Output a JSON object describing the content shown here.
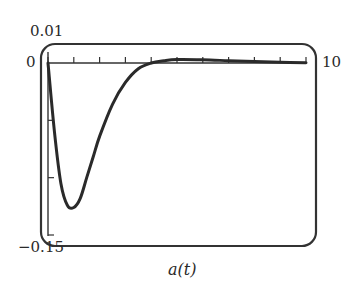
{
  "chart_data": {
    "type": "line",
    "title": "",
    "xlabel": "a(t)",
    "ylabel": "",
    "xlim": [
      0,
      10
    ],
    "ylim": [
      -0.15,
      0.01
    ],
    "tick_labels": {
      "y_top": "0.01",
      "y_zero": "0",
      "y_bottom": "−0.15",
      "x_max": "10"
    },
    "x_ticks": [
      0,
      1,
      2,
      3,
      4,
      5,
      6,
      7,
      8,
      9,
      10
    ],
    "y_ticks": [
      -0.05,
      -0.1,
      -0.15
    ],
    "grid": false,
    "legend": null,
    "series": [
      {
        "name": "a(t)",
        "x": [
          0,
          0.25,
          0.5,
          0.75,
          1.0,
          1.25,
          1.5,
          1.75,
          2.0,
          2.5,
          3.0,
          3.5,
          4.0,
          4.5,
          5.0,
          6.0,
          7.0,
          8.0,
          9.0,
          10.0
        ],
        "values": [
          0,
          -0.06,
          -0.105,
          -0.124,
          -0.126,
          -0.118,
          -0.1,
          -0.082,
          -0.064,
          -0.036,
          -0.017,
          -0.005,
          0.0,
          0.002,
          0.003,
          0.0028,
          0.002,
          0.0012,
          0.0006,
          0.0002
        ]
      }
    ]
  },
  "labels": {
    "y_top": "0.01",
    "y_zero": "0",
    "y_bottom": "−0.15",
    "x_max": "10",
    "x_title": "a(t)"
  },
  "colors": {
    "line": "#2a2a2a",
    "frame": "#333333"
  }
}
